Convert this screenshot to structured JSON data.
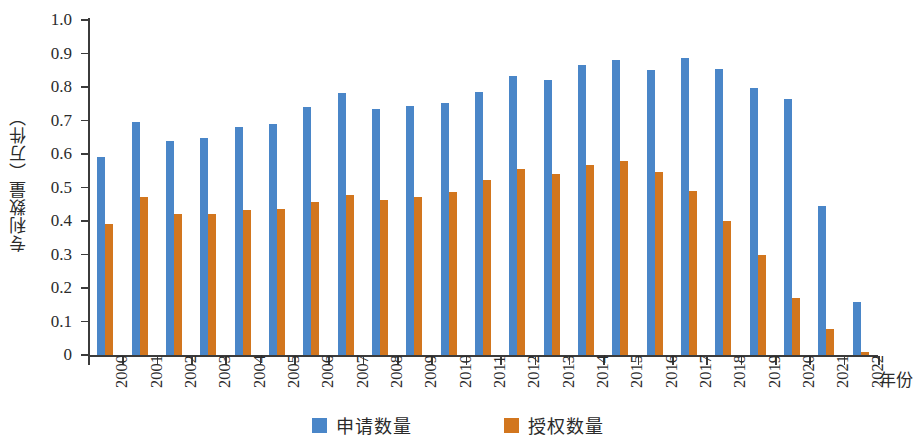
{
  "chart_data": {
    "type": "bar",
    "title": "",
    "xlabel": "年份",
    "ylabel": "专利数量（万件）",
    "ylim": [
      0,
      1.0
    ],
    "ytick_labels": [
      "1.0",
      "0.9",
      "0.8",
      "0.7",
      "0.6",
      "0.5",
      "0.4",
      "0.3",
      "0.2",
      "0.1",
      "0"
    ],
    "ytick_values": [
      1.0,
      0.9,
      0.8,
      0.7,
      0.6,
      0.5,
      0.4,
      0.3,
      0.2,
      0.1,
      0
    ],
    "grid": false,
    "legend_position": "bottom-center",
    "categories": [
      "2000",
      "2001",
      "2002",
      "2003",
      "2004",
      "2005",
      "2006",
      "2007",
      "2008",
      "2009",
      "2010",
      "2011",
      "2012",
      "2013",
      "2014",
      "2015",
      "2016",
      "2017",
      "2018",
      "2019",
      "2020",
      "2021",
      "2022"
    ],
    "series": [
      {
        "name": "申请数量",
        "color": "#4a86c8",
        "values": [
          0.592,
          0.695,
          0.639,
          0.648,
          0.681,
          0.691,
          0.739,
          0.783,
          0.734,
          0.742,
          0.751,
          0.784,
          0.832,
          0.82,
          0.866,
          0.881,
          0.851,
          0.886,
          0.854,
          0.797,
          0.763,
          0.445,
          0.157
        ]
      },
      {
        "name": "授权数量",
        "color": "#d2761e",
        "values": [
          0.39,
          0.473,
          0.42,
          0.422,
          0.432,
          0.436,
          0.456,
          0.477,
          0.463,
          0.472,
          0.487,
          0.521,
          0.556,
          0.54,
          0.568,
          0.58,
          0.545,
          0.489,
          0.399,
          0.299,
          0.171,
          0.078,
          0.008
        ]
      }
    ]
  },
  "legend": {
    "items": [
      {
        "label": "申请数量",
        "color": "#4a86c8"
      },
      {
        "label": "授权数量",
        "color": "#d2761e"
      }
    ]
  },
  "axes": {
    "y_title": "专利数量（万件）",
    "x_title": "年份"
  }
}
